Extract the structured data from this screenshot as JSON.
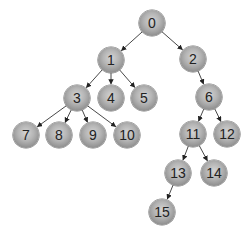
{
  "diagram": {
    "type": "tree",
    "nodes": [
      {
        "id": "0",
        "label": "0",
        "x": 152,
        "y": 23
      },
      {
        "id": "1",
        "label": "1",
        "x": 111,
        "y": 60
      },
      {
        "id": "2",
        "label": "2",
        "x": 193,
        "y": 59
      },
      {
        "id": "3",
        "label": "3",
        "x": 77,
        "y": 98
      },
      {
        "id": "4",
        "label": "4",
        "x": 111,
        "y": 98
      },
      {
        "id": "5",
        "label": "5",
        "x": 144,
        "y": 98
      },
      {
        "id": "6",
        "label": "6",
        "x": 209,
        "y": 97
      },
      {
        "id": "7",
        "label": "7",
        "x": 26,
        "y": 135
      },
      {
        "id": "8",
        "label": "8",
        "x": 59,
        "y": 135
      },
      {
        "id": "9",
        "label": "9",
        "x": 93,
        "y": 135
      },
      {
        "id": "10",
        "label": "10",
        "x": 127,
        "y": 135
      },
      {
        "id": "11",
        "label": "11",
        "x": 193,
        "y": 134
      },
      {
        "id": "12",
        "label": "12",
        "x": 227,
        "y": 134
      },
      {
        "id": "13",
        "label": "13",
        "x": 178,
        "y": 173
      },
      {
        "id": "14",
        "label": "14",
        "x": 214,
        "y": 173
      },
      {
        "id": "15",
        "label": "15",
        "x": 162,
        "y": 212
      }
    ],
    "edges": [
      {
        "from": "0",
        "to": "1"
      },
      {
        "from": "0",
        "to": "2"
      },
      {
        "from": "1",
        "to": "3"
      },
      {
        "from": "1",
        "to": "4"
      },
      {
        "from": "1",
        "to": "5"
      },
      {
        "from": "2",
        "to": "6"
      },
      {
        "from": "3",
        "to": "7"
      },
      {
        "from": "3",
        "to": "8"
      },
      {
        "from": "3",
        "to": "9"
      },
      {
        "from": "3",
        "to": "10"
      },
      {
        "from": "6",
        "to": "11"
      },
      {
        "from": "6",
        "to": "12"
      },
      {
        "from": "11",
        "to": "13"
      },
      {
        "from": "11",
        "to": "14"
      },
      {
        "from": "13",
        "to": "15"
      }
    ],
    "colors": {
      "node_light": "#d4d4d4",
      "node_dark": "#6e6e6e",
      "edge": "#333333",
      "label": "#222222"
    }
  }
}
